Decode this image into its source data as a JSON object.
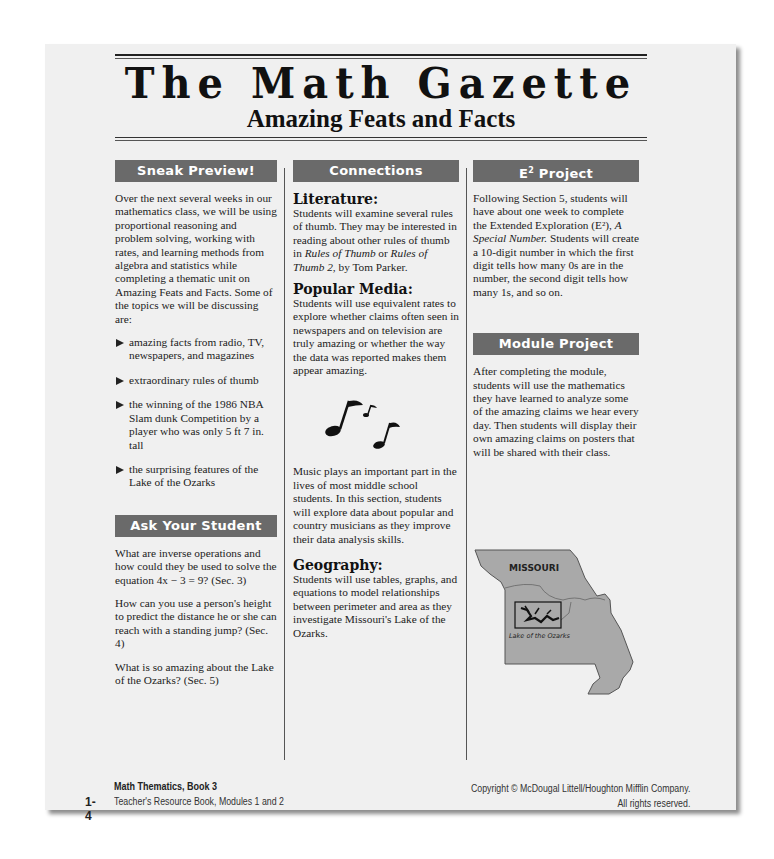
{
  "masthead": {
    "title": "The Math Gazette",
    "subtitle": "Amazing Feats and Facts"
  },
  "sneak_preview": {
    "heading": "Sneak Preview!",
    "intro": "Over the next several weeks in our mathematics class, we will be using proportional reasoning and problem solving, working with rates, and learning methods from algebra and statistics while completing a thematic unit on Amazing Feats and Facts. Some of the topics we will be discussing are:",
    "topics": [
      "amazing facts from radio, TV, newspapers, and magazines",
      "extraordinary rules of thumb",
      "the winning of the 1986 NBA Slam dunk Competition by a player who was only 5 ft 7 in. tall",
      "the surprising features of the Lake of the Ozarks"
    ]
  },
  "ask_your_student": {
    "heading": "Ask Your Student",
    "questions": [
      "What are inverse operations and how could they be used to solve the equation 4x − 3 = 9? (Sec. 3)",
      "How can you use a person's height to predict the distance he or she can reach with a standing jump? (Sec. 4)",
      "What is so amazing about the Lake of the Ozarks? (Sec. 5)"
    ]
  },
  "connections": {
    "heading": "Connections",
    "literature": {
      "title": "Literature:",
      "text_1": "Students will examine several rules of thumb. They may be interested in reading about other rules of thumb in ",
      "book_1": "Rules of Thumb",
      "or": " or ",
      "book_2": "Rules of Thumb 2",
      "text_2": ", by Tom Parker."
    },
    "popular_media": {
      "title": "Popular Media:",
      "text": "Students will use equivalent rates to explore whether claims often seen in newspapers and on television are truly amazing or whether the way the data was reported makes them appear amazing."
    },
    "music": {
      "icon": "music-notes-icon",
      "text": "Music plays an important part in the lives of most middle school students. In this section, students will explore data about popular and country musicians as they improve their data analysis skills."
    },
    "geography": {
      "title": "Geography:",
      "text": "Students will use tables, graphs, and equations to model relationships between perimeter and area as they investigate Missouri's Lake of the Ozarks."
    }
  },
  "e2_project": {
    "heading_main": "E",
    "heading_sup": "2",
    "heading_rest": " Project",
    "text_1": "Following Section 5, students will have about one week to complete the Extended Exploration (E²), ",
    "italic": "A Special Number.",
    "text_2": " Students will create a 10-digit number in which the first digit tells how many 0s are in the number, the second digit tells how many 1s, and so on."
  },
  "module_project": {
    "heading": "Module Project",
    "text": "After completing the module, students will use the mathematics they have learned to analyze some of the amazing claims we hear every day. Then students will display their own amazing claims on posters that will be shared with their class."
  },
  "map": {
    "state_label": "MISSOURI",
    "lake_label": "Lake of the Ozarks",
    "fill_color": "#a9a9a9"
  },
  "footer": {
    "page_number": "1-4",
    "book_title": "Math Thematics, Book 3",
    "book_subtitle": "Teacher's Resource Book, Modules 1 and 2",
    "copyright": "Copyright © McDougal Littell/Houghton Mifflin Company.",
    "rights": "All rights reserved."
  },
  "colors": {
    "section_header_bg": "#6a6a6a",
    "page_bg": "#f0f0f0"
  }
}
